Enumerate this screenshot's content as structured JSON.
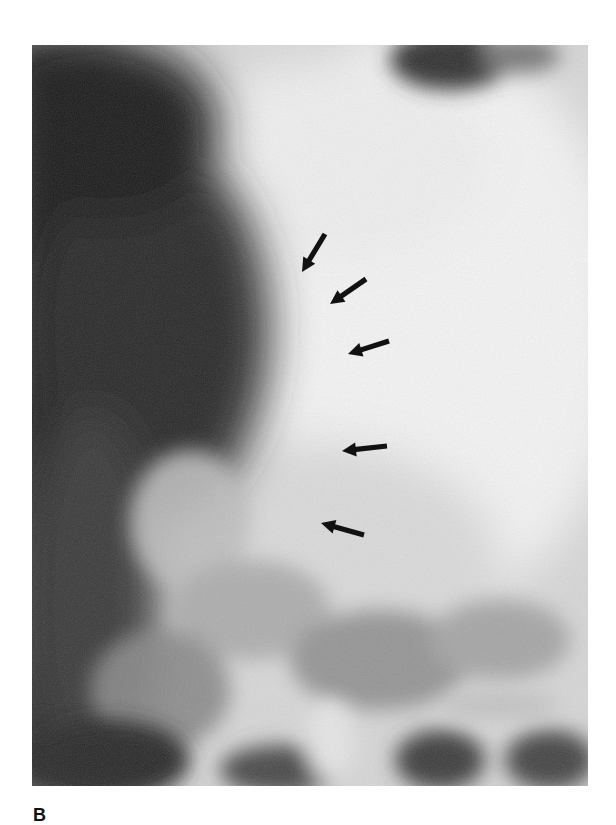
{
  "figure": {
    "panel_label": "B",
    "image_type": "radiograph",
    "colors": {
      "background": "#ffffff",
      "arrow": "#111111",
      "dark_region": "#1a1a1a",
      "bright_region": "#f2f2f2"
    },
    "arrows": [
      {
        "tail": [
          325,
          234
        ],
        "tip": [
          302,
          272
        ]
      },
      {
        "tail": [
          366,
          279
        ],
        "tip": [
          330,
          304
        ]
      },
      {
        "tail": [
          389,
          341
        ],
        "tip": [
          348,
          354
        ]
      },
      {
        "tail": [
          387,
          446
        ],
        "tip": [
          342,
          451
        ]
      },
      {
        "tail": [
          364,
          535
        ],
        "tip": [
          321,
          523
        ]
      }
    ]
  }
}
